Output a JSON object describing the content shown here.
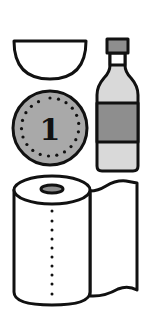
{
  "scene": {
    "description": "Grocery item icons illustration",
    "items": [
      {
        "name": "bowl",
        "fill": "#ffffff"
      },
      {
        "name": "bottle",
        "cap_fill": "#8e8e8e",
        "body_fill": "#d9d9d9",
        "label_fill": "#8e8e8e"
      },
      {
        "name": "coin",
        "fill": "#a9a9a9",
        "label": "1"
      },
      {
        "name": "paper-towel-roll",
        "fill": "#ffffff",
        "core_fill": "#8e8e8e"
      }
    ]
  },
  "coin": {
    "label": "1"
  },
  "colors": {
    "outline": "#111111",
    "light_gray": "#d9d9d9",
    "mid_gray": "#a9a9a9",
    "dark_gray": "#8e8e8e",
    "background": "#ffffff"
  }
}
